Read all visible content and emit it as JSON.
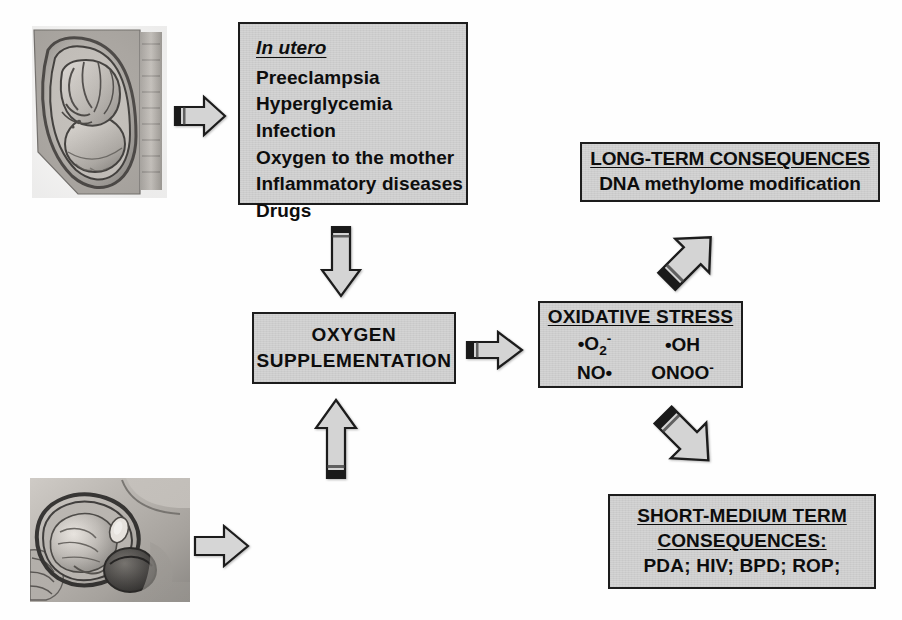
{
  "diagram": {
    "colors": {
      "box_fill": "#d2d2d2",
      "box_border": "#1c1c1c",
      "arrow_fill": "#d0d0d0",
      "arrow_border": "#1c1c1c",
      "arrow_tail_band": "#1a1a1a",
      "background": "#fefefe",
      "text": "#0d0d0d"
    },
    "boxes": {
      "in_utero": {
        "header": "In utero",
        "items": [
          "Preeclampsia",
          "Hyperglycemia",
          "Infection",
          "Oxygen to the mother",
          "Inflammatory diseases",
          "Drugs"
        ]
      },
      "delivery_complications": {
        "header": "Delivery complications",
        "items": [
          "Hypoxia – reoxygenation",
          "Hyperoxia",
          "Ischemia - transfusion",
          "Asphyxia"
        ]
      },
      "oxygen_supplementation": {
        "line1": "OXYGEN",
        "line2": "SUPPLEMENTATION"
      },
      "oxidative_stress": {
        "title": "OXIDATIVE STRESS",
        "radicals": [
          {
            "prefix": "•",
            "base": "O",
            "sub": "2",
            "sup": "-"
          },
          {
            "prefix": "•",
            "base": "OH",
            "sub": "",
            "sup": ""
          },
          {
            "prefix": "",
            "base": "NO•",
            "sub": "",
            "sup": ""
          },
          {
            "prefix": "",
            "base": "ONOO",
            "sub": "",
            "sup": "-"
          }
        ],
        "radical_labels": [
          "•O2-",
          "•OH",
          "NO•",
          "ONOO-"
        ]
      },
      "long_term_consequences": {
        "title": "LONG-TERM CONSEQUENCES",
        "subtitle": "DNA methylome modification"
      },
      "short_medium_consequences": {
        "title_line1": "SHORT-MEDIUM TERM",
        "title_line2": "CONSEQUENCES:",
        "values": "PDA; HIV; BPD; ROP;"
      }
    },
    "figures": {
      "fetus_in_utero": {
        "caption": "fetus-in-utero-illustration"
      },
      "delivery": {
        "caption": "delivery-illustration"
      }
    },
    "arrows": [
      {
        "name": "fetus-to-in-utero",
        "direction": "right"
      },
      {
        "name": "in-utero-to-oxygen",
        "direction": "down"
      },
      {
        "name": "oxygen-to-oxidative-stress",
        "direction": "right"
      },
      {
        "name": "delivery-figure-to-delivery-box",
        "direction": "right"
      },
      {
        "name": "delivery-to-oxygen",
        "direction": "up"
      },
      {
        "name": "oxidative-stress-to-long-term",
        "direction": "up-right"
      },
      {
        "name": "oxidative-stress-to-short-medium",
        "direction": "down-right"
      }
    ]
  }
}
